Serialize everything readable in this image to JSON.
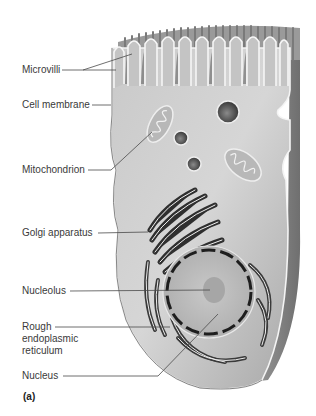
{
  "figure": {
    "panel_label": "(a)",
    "labels": [
      {
        "id": "microvilli",
        "text": "Microvilli"
      },
      {
        "id": "cell-membrane",
        "text": "Cell membrane"
      },
      {
        "id": "mitochondrion",
        "text": "Mitochondrion"
      },
      {
        "id": "golgi",
        "text": "Golgi apparatus"
      },
      {
        "id": "nucleolus",
        "text": "Nucleolus"
      },
      {
        "id": "rough-er",
        "text": "Rough endoplasmic reticulum"
      },
      {
        "id": "nucleus",
        "text": "Nucleus"
      }
    ]
  },
  "colors": {
    "cytoplasm": "#bdbdbd",
    "membrane": "#f2f2f2",
    "dark": "#3c3c3c",
    "leader": "#4a4a4a",
    "text": "#3a3a3a"
  }
}
